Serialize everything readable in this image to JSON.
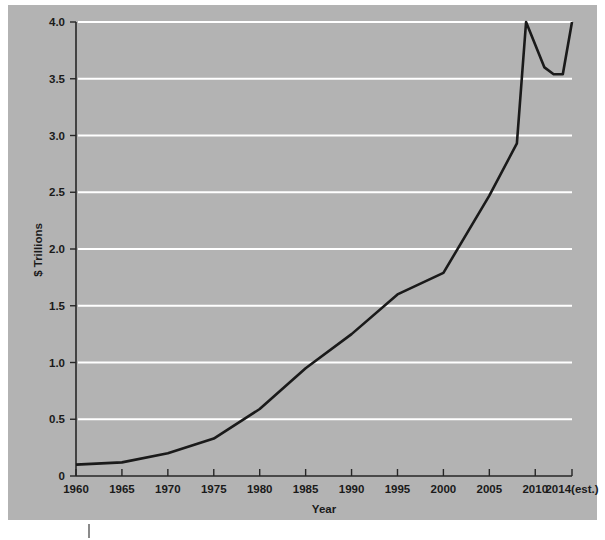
{
  "figure": {
    "panel_color": "#b3b3b3",
    "page_background": "#ffffff",
    "line_color": "#1a1a1a",
    "gridline_color": "#ffffff",
    "axis_color": "#262626"
  },
  "chart_data": {
    "type": "line",
    "title": "",
    "subtitle": "",
    "xlabel": "Year",
    "ylabel": "$ Trillions",
    "xlim": [
      1960,
      2014
    ],
    "ylim": [
      0,
      4.0
    ],
    "grid": "horizontal",
    "legend": "none",
    "x_tick_labels": [
      "1960",
      "1965",
      "1970",
      "1975",
      "1980",
      "1985",
      "1990",
      "1995",
      "2000",
      "2005",
      "2010",
      "2014(est.)"
    ],
    "x_tick_values": [
      1960,
      1965,
      1970,
      1975,
      1980,
      1985,
      1990,
      1995,
      2000,
      2005,
      2010,
      2014
    ],
    "y_tick_labels": [
      "0",
      "0.5",
      "1.0",
      "1.5",
      "2.0",
      "2.5",
      "3.0",
      "3.5",
      "4.0"
    ],
    "y_tick_values": [
      0,
      0.5,
      1.0,
      1.5,
      2.0,
      2.5,
      3.0,
      3.5,
      4.0
    ],
    "series": [
      {
        "name": "Federal spending",
        "color": "#1a1a1a",
        "x": [
          1960,
          1965,
          1970,
          1975,
          1980,
          1985,
          1990,
          1995,
          2000,
          2005,
          2008,
          2009,
          2011,
          2012,
          2013,
          2014
        ],
        "values": [
          0.1,
          0.12,
          0.2,
          0.33,
          0.59,
          0.95,
          1.25,
          1.6,
          1.79,
          2.47,
          2.93,
          4.0,
          3.6,
          3.54,
          3.54,
          4.0
        ]
      }
    ],
    "annotations": []
  }
}
